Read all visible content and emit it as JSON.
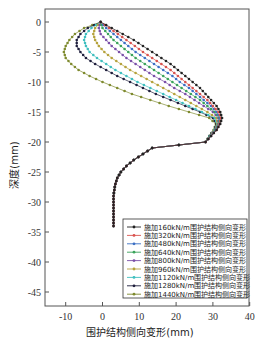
{
  "chart_data": {
    "type": "line",
    "title": "",
    "xlabel": "围护结构侧向变形(mm)",
    "ylabel": "深度(mm)",
    "xlim": [
      -15,
      40
    ],
    "ylim": [
      -48,
      2
    ],
    "xticks": [
      -10,
      0,
      10,
      20,
      30,
      40
    ],
    "yticks": [
      0,
      -5,
      -10,
      -15,
      -20,
      -25,
      -30,
      -35,
      -40,
      -45
    ],
    "grid": false,
    "legend_position": "lower right",
    "depths": [
      0,
      -1,
      -2,
      -3,
      -4,
      -5,
      -6,
      -7,
      -8,
      -9,
      -10,
      -11,
      -12,
      -13,
      -14,
      -15,
      -16,
      -17,
      -18,
      -19,
      -20,
      -21,
      -22,
      -23,
      -24,
      -25,
      -26,
      -27,
      -28,
      -29,
      -30,
      -31,
      -32,
      -33,
      -34
    ],
    "shared_tail_x": [
      30.5,
      28.5,
      26,
      23.5,
      21,
      18.5,
      16,
      13.5,
      11,
      8.5,
      6.5,
      5,
      4,
      3.5,
      3.2,
      3.0,
      3.0,
      3.0,
      3.0,
      3.0,
      3.0
    ],
    "series": [
      {
        "name": "施加160kN/m围护结构侧向变形",
        "color": "#222222",
        "x": [
          -0.5,
          2.5,
          5.5,
          8.5,
          11,
          13.5,
          16,
          18.5,
          20.5,
          22.5,
          24.5,
          26.5,
          28,
          29.5,
          31,
          32,
          32.5,
          32,
          31,
          29.5,
          28
        ]
      },
      {
        "name": "施加320kN/m围护结构侧向变形",
        "color": "#d9534f",
        "x": [
          -0.5,
          1.8,
          4.2,
          6.5,
          8.8,
          11,
          13.5,
          16,
          18.5,
          20.5,
          22.5,
          24.5,
          26.5,
          28.5,
          30,
          31.5,
          32.2,
          31.8,
          31,
          29.5,
          28
        ]
      },
      {
        "name": "施加480kN/m围护结构侧向变形",
        "color": "#3b6fc4",
        "x": [
          -0.5,
          1,
          3,
          5,
          7,
          9,
          11.5,
          14,
          16.5,
          19,
          21,
          23.5,
          25.5,
          27.5,
          29.5,
          31,
          32,
          31.8,
          30.8,
          29.5,
          28
        ]
      },
      {
        "name": "施加640kN/m围护结构侧向变形",
        "color": "#3aa35a",
        "x": [
          -0.5,
          0,
          1.5,
          3,
          5,
          7,
          9,
          11.5,
          14,
          16.5,
          19,
          21.5,
          24,
          26.5,
          28.5,
          30.5,
          31.8,
          31.6,
          30.7,
          29.4,
          28
        ]
      },
      {
        "name": "施加800kN/m围护结构侧向变形",
        "color": "#7a4fa8",
        "x": [
          -0.5,
          -1,
          -0.5,
          1,
          2.5,
          4.5,
          6.5,
          9,
          11.5,
          14,
          17,
          19.5,
          22.5,
          25,
          27.5,
          30,
          31.5,
          31.5,
          30.6,
          29.3,
          28
        ]
      },
      {
        "name": "施加960kN/m围护结构侧向变形",
        "color": "#b5a23c",
        "x": [
          -0.5,
          -2,
          -2.5,
          -2,
          -1,
          0.5,
          2.5,
          5,
          7.5,
          10.5,
          13.5,
          16.5,
          19.5,
          22.5,
          25.5,
          28.5,
          31,
          31.3,
          30.5,
          29.2,
          28
        ]
      },
      {
        "name": "施加1120kN/m围护结构侧向变形",
        "color": "#3fbfbf",
        "x": [
          -0.5,
          -3,
          -4.5,
          -5,
          -4.5,
          -3.5,
          -1.5,
          1,
          3.5,
          6.5,
          9.5,
          13,
          16.5,
          20,
          23.5,
          27,
          30.5,
          31.2,
          30.4,
          29.1,
          28
        ]
      },
      {
        "name": "施加1280kN/m围护结构侧向变形",
        "color": "#1e1e3c",
        "x": [
          -0.5,
          -4,
          -6,
          -7,
          -7,
          -6,
          -4.5,
          -2,
          1,
          4,
          7.5,
          11,
          14.5,
          18.5,
          22.5,
          26.5,
          30,
          31,
          30.3,
          29,
          28
        ]
      },
      {
        "name": "施加1440kN/m围护结构侧向变形",
        "color": "#7e8a2e",
        "x": [
          -0.5,
          -5,
          -7.5,
          -9,
          -10,
          -10.5,
          -10,
          -8.5,
          -6.5,
          -3.5,
          0,
          4,
          8,
          13,
          18,
          23.5,
          29,
          30.8,
          30.2,
          29,
          28
        ]
      }
    ]
  },
  "axes": {
    "x_ticks": [
      "-10",
      "0",
      "10",
      "20",
      "30",
      "40"
    ],
    "y_ticks": [
      "0",
      "-5",
      "-10",
      "-15",
      "-20",
      "-25",
      "-30",
      "-35",
      "-40",
      "-45"
    ]
  },
  "legend": {
    "items": [
      "施加160kN/m围护结构侧向变形",
      "施加320kN/m围护结构侧向变形",
      "施加480kN/m围护结构侧向变形",
      "施加640kN/m围护结构侧向变形",
      "施加800kN/m围护结构侧向变形",
      "施加960kN/m围护结构侧向变形",
      "施加1120kN/m围护结构侧向变形",
      "施加1280kN/m围护结构侧向变形",
      "施加1440kN/m围护结构侧向变形"
    ]
  }
}
